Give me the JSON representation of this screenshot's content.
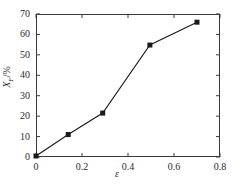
{
  "chart_data": {
    "type": "line",
    "title": "",
    "subtitle": "",
    "xlabel": "ε",
    "ylabel": "X_F/%",
    "ylabel_symbol": "X",
    "ylabel_subscript": "F",
    "ylabel_unit": "/%",
    "xlim": [
      0,
      0.8
    ],
    "ylim": [
      0,
      70
    ],
    "xticks": [
      0,
      0.2,
      0.4,
      0.6,
      0.8
    ],
    "xtick_labels": [
      "0",
      "0.2",
      "0.4",
      "0.6",
      "0.8"
    ],
    "yticks": [
      0,
      10,
      20,
      30,
      40,
      50,
      60,
      70
    ],
    "ytick_labels": [
      "0",
      "10",
      "20",
      "30",
      "40",
      "50",
      "60",
      "70"
    ],
    "grid": false,
    "legend": false,
    "legend_position": "none",
    "marker": "filled-square",
    "marker_color": "#1a1a1a",
    "line_color": "#1a1a1a",
    "axis_color": "#3a3a3a",
    "x": [
      0.0,
      0.14,
      0.29,
      0.495,
      0.7
    ],
    "values": [
      0.5,
      11.0,
      21.5,
      54.8,
      66.0
    ],
    "points": [
      {
        "x": 0.0,
        "y": 0.5
      },
      {
        "x": 0.14,
        "y": 11.0
      },
      {
        "x": 0.29,
        "y": 21.5
      },
      {
        "x": 0.495,
        "y": 54.8
      },
      {
        "x": 0.7,
        "y": 66.0
      }
    ]
  }
}
